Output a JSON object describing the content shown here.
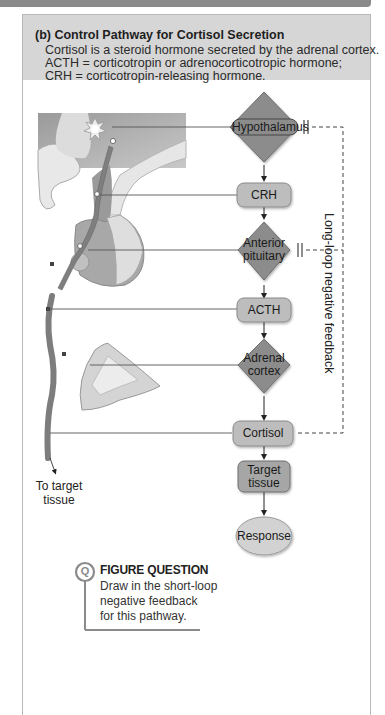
{
  "panel": {
    "title": "(b) Control Pathway for Cortisol Secretion",
    "description": [
      "Cortisol is a steroid hormone secreted by the adrenal cortex.",
      "ACTH = corticotropin or adrenocorticotropic hormone;",
      "CRH = corticotropin-releasing hormone."
    ]
  },
  "pathway": {
    "nodes": [
      {
        "id": "hypothalamus",
        "label": "Hypothalamus",
        "shape": "diamond"
      },
      {
        "id": "crh",
        "label": "CRH",
        "shape": "rounded-rect"
      },
      {
        "id": "anterior_pituitary",
        "label_line1": "Anterior",
        "label_line2": "pituitary",
        "shape": "diamond"
      },
      {
        "id": "acth",
        "label": "ACTH",
        "shape": "rounded-rect"
      },
      {
        "id": "adrenal_cortex",
        "label_line1": "Adrenal",
        "label_line2": "cortex",
        "shape": "diamond"
      },
      {
        "id": "cortisol",
        "label": "Cortisol",
        "shape": "rounded-rect"
      },
      {
        "id": "target_tissue",
        "label_line1": "Target",
        "label_line2": "tissue",
        "shape": "rounded-rect"
      },
      {
        "id": "response",
        "label": "Response",
        "shape": "ellipse"
      }
    ],
    "feedback_label": "Long-loop negative feedback",
    "illustration_label_line1": "To target",
    "illustration_label_line2": "tissue"
  },
  "figure_question": {
    "icon": "Q",
    "title": "FIGURE QUESTION",
    "lines": [
      "Draw in the short-loop",
      "negative feedback",
      "for this pathway."
    ]
  },
  "colors": {
    "header_band": "#8a8a8a",
    "panel_header": "#d6d6d6",
    "diamond_fill": "#8c8c8c",
    "box_fill": "#bdbdbd",
    "ellipse_fill": "#d2d2d2"
  }
}
